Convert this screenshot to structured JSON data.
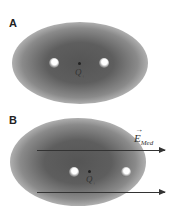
{
  "panels": [
    {
      "label": "A",
      "charge_label": "Q",
      "charge_subscript": "+"
    },
    {
      "label": "B",
      "charge_label": "Q",
      "charge_subscript": "+",
      "field_label": "E",
      "field_subscript": "Med",
      "field_vector_mark": "→"
    }
  ]
}
